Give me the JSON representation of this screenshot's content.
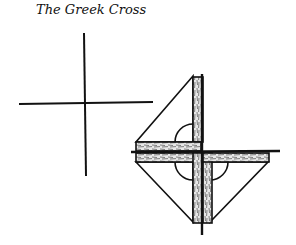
{
  "figure": {
    "title": "The Greek Cross",
    "left_figure": "simple-cross",
    "right_figure": "folded-strips-cross"
  }
}
